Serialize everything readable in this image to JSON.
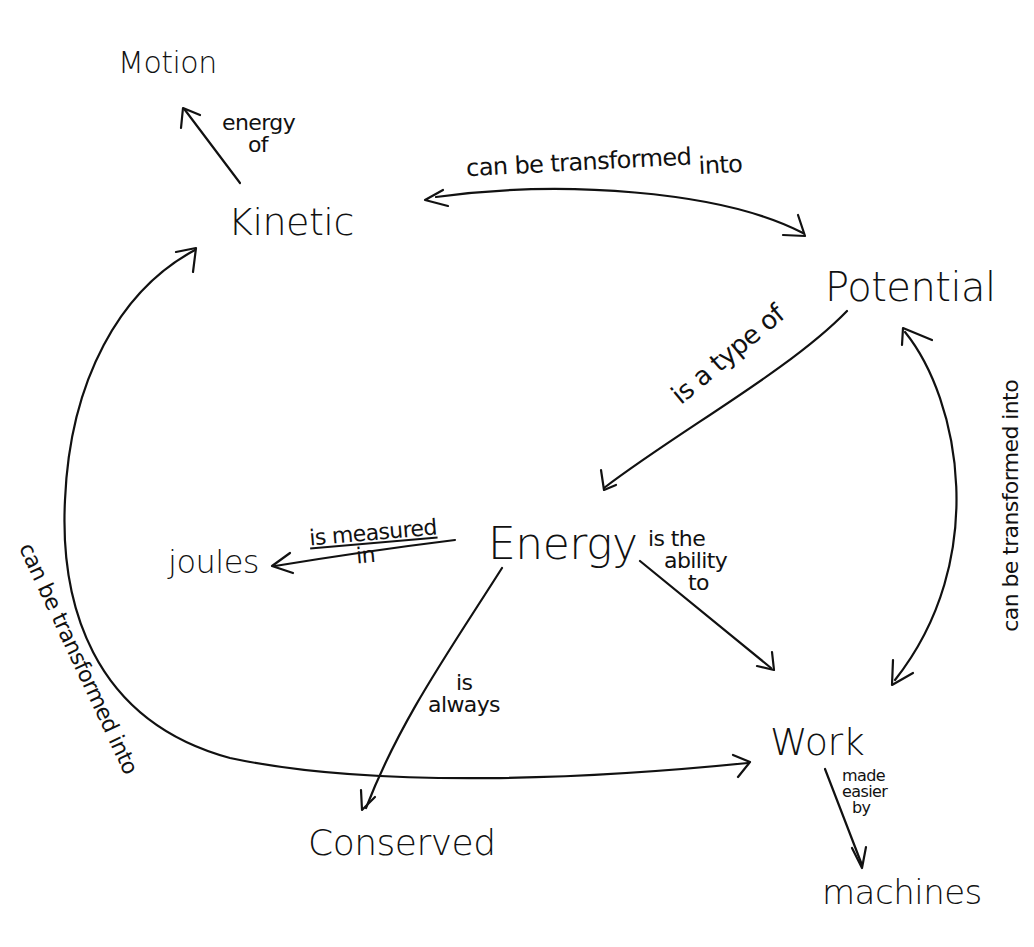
{
  "nodes": {
    "motion": "Motion",
    "kinetic": "Kinetic",
    "potential": "Potential",
    "energy": "Energy",
    "joules": "joules",
    "conserved": "Conserved",
    "work": "Work",
    "machines": "machines"
  },
  "links": {
    "kinetic_motion_1": "energy",
    "kinetic_motion_2": "of",
    "kinetic_potential_1": "can be transformed",
    "kinetic_potential_2": "into",
    "potential_energy": "is a type of",
    "energy_joules_1": "is measured",
    "energy_joules_2": "in",
    "energy_work_1": "is the",
    "energy_work_2": "ability",
    "energy_work_3": "to",
    "energy_conserved_1": "is",
    "energy_conserved_2": "always",
    "potential_work": "can be transformed into",
    "work_kinetic": "can be transformed into",
    "work_machines_1": "made",
    "work_machines_2": "easier",
    "work_machines_3": "by"
  },
  "colors": {
    "ink": "#111111",
    "paper": "#ffffff"
  }
}
